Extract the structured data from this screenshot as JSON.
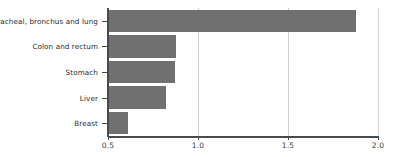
{
  "chart_data": {
    "type": "bar",
    "orientation": "horizontal",
    "title": "",
    "subtitle": "",
    "xlabel": "",
    "ylabel": "",
    "categories": [
      "Tracheal, bronchus and lung",
      "Colon and rectum",
      "Stomach",
      "Liver",
      "Breast"
    ],
    "values": [
      1.88,
      0.88,
      0.87,
      0.82,
      0.61
    ],
    "xlim": [
      0.5,
      2.0
    ],
    "xticks": [
      0.5,
      1.0,
      1.5,
      2.0
    ],
    "xtick_labels": [
      "0.5",
      "1.0",
      "1.5",
      "2.0"
    ],
    "grid": true,
    "grid_axis": "x",
    "legend": null,
    "bar_color": "#707070",
    "grid_color": "#cfcfcf",
    "axis_color": "#4a4a4a",
    "background": "#ffffff"
  }
}
